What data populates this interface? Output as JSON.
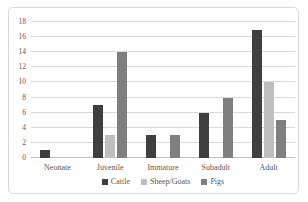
{
  "colors": {
    "background": "#ffffff",
    "frame_border": "#d9d9d9",
    "gridline": "#d9d9d9",
    "axis_line": "#bfbfbf",
    "text": "#595959",
    "cattle": "#3f3f3f",
    "sheep_goats": "#bfbfbf",
    "pigs": "#7f7f7f"
  },
  "chart_data": {
    "type": "bar",
    "title": "",
    "xlabel": "",
    "ylabel": "",
    "categories": [
      "Neonate",
      "Juvenile",
      "Immature",
      "Subadult",
      "Adult"
    ],
    "series": [
      {
        "name": "Cattle",
        "color": "#3f3f3f",
        "values": [
          1,
          7,
          3,
          6,
          17
        ]
      },
      {
        "name": "Sheep/Goats",
        "color": "#bfbfbf",
        "values": [
          0,
          3,
          0,
          0,
          10
        ]
      },
      {
        "name": "Pigs",
        "color": "#7f7f7f",
        "values": [
          0,
          14,
          3,
          8,
          5
        ]
      }
    ],
    "ylim": [
      0,
      18
    ],
    "ytick_step": 2,
    "ytick_labels": [
      "0",
      "2",
      "4",
      "6",
      "8",
      "10",
      "12",
      "14",
      "16",
      "18"
    ],
    "grid": true,
    "legend_position": "bottom"
  }
}
